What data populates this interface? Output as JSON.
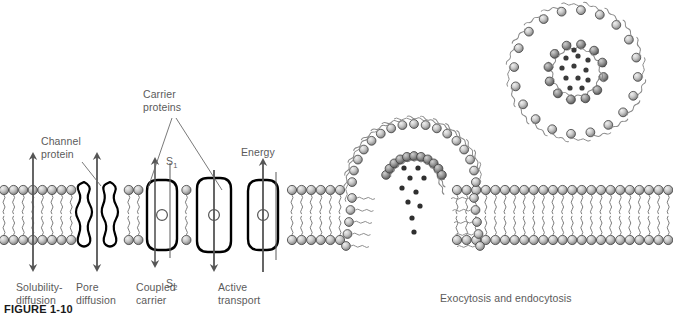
{
  "figure": {
    "caption_label": "FIGURE 1-10",
    "bottom_caption": "Exocytosis and endocytosis",
    "colors": {
      "text": "#5b5b5b",
      "head_light": "#d8d8d8",
      "head_dark": "#6f6f6f",
      "outline": "#3a3a3a",
      "protein_outline": "#000000",
      "cargo": "#333333",
      "background": "#ffffff"
    }
  },
  "callouts": {
    "channel_protein": "Channel\nprotein",
    "carrier_proteins": "Carrier\nproteins",
    "energy": "Energy",
    "s1": "S",
    "s1_sub": "1",
    "s2": "S",
    "s2_sub": "2"
  },
  "mechanisms": [
    {
      "id": "solubility-diffusion",
      "label": "Solubility-\ndiffusion",
      "x": 16,
      "y": 281
    },
    {
      "id": "pore-diffusion",
      "label": "Pore\ndiffusion",
      "x": 76,
      "y": 281
    },
    {
      "id": "coupled-carrier",
      "label": "Coupled\ncarrier",
      "x": 136,
      "y": 281
    },
    {
      "id": "active-transport",
      "label": "Active\ntransport",
      "x": 218,
      "y": 281
    }
  ],
  "chart_data": {
    "type": "diagram",
    "elements": [
      "lipid bilayer membrane",
      "solubility-diffusion double arrow",
      "channel protein pore with double arrow",
      "coupled carrier protein with S1 in and S2 out",
      "carrier protein with downward arrow",
      "active transport carrier with energy arrow",
      "vesicle fusing with membrane releasing cargo",
      "free vesicle with cargo"
    ]
  }
}
